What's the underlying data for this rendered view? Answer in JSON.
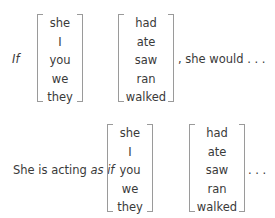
{
  "example1": {
    "lead": "If",
    "subjects": [
      "she",
      "I",
      "you",
      "we",
      "they"
    ],
    "verbs": [
      "had",
      "ate",
      "saw",
      "ran",
      "walked"
    ],
    "tail": ", she would . . ."
  },
  "example2": {
    "lead_plain": "She is acting ",
    "lead_italic": "as if",
    "subjects": [
      "she",
      "I",
      "you",
      "we",
      "they"
    ],
    "verbs": [
      "had",
      "ate",
      "saw",
      "ran",
      "walked"
    ],
    "tail": ". . ."
  }
}
